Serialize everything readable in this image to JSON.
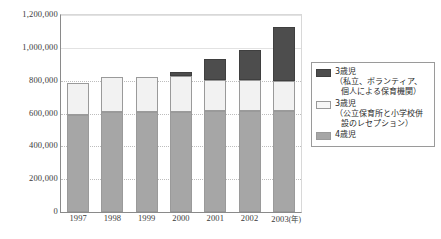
{
  "chart_data": {
    "type": "bar",
    "title": "",
    "subtitle": "",
    "xlabel": "(年)",
    "ylabel": "",
    "stacked": true,
    "grid": true,
    "legend_position": "right",
    "ylim": [
      0,
      1200000
    ],
    "ytick_step": 200000,
    "categories": [
      "1997",
      "1998",
      "1999",
      "2000",
      "2001",
      "2002",
      "2003"
    ],
    "ytick_labels": [
      "0",
      "200,000",
      "400,000",
      "600,000",
      "800,000",
      "1,000,000",
      "1,200,000"
    ],
    "ytick_values": [
      0,
      200000,
      400000,
      600000,
      800000,
      1000000,
      1200000
    ],
    "xtick_labels": [
      "1997",
      "1998",
      "1999",
      "2000",
      "2001",
      "2002",
      "2003"
    ],
    "xaxis_unit": "(年)",
    "series": [
      {
        "name": "4歳児",
        "key": "y4",
        "color": "#a6a6a6",
        "values": [
          588000,
          608000,
          610000,
          612000,
          614000,
          616000,
          618000
        ]
      },
      {
        "name": "3歳児（公立保育所と小学校併設のレセプション）",
        "key": "y3pub",
        "color": "#f2f2f2",
        "values": [
          197000,
          214000,
          211000,
          216000,
          192000,
          190000,
          182000
        ]
      },
      {
        "name": "3歳児（私立、ボランティア、個人による保育機関）",
        "key": "y3priv",
        "color": "#4d4d4d",
        "values": [
          0,
          0,
          0,
          22000,
          129000,
          179000,
          330000
        ]
      }
    ],
    "totals": [
      785000,
      822000,
      821000,
      850000,
      935000,
      985000,
      1130000
    ]
  },
  "legend": {
    "items": [
      {
        "swatch": "y3priv",
        "main": "3歳児",
        "sub": "（私立、ボランティア、",
        "sub2": "個人による保育機関）"
      },
      {
        "swatch": "y3pub",
        "main": "3歳児",
        "sub": "（公立保育所と小学校併",
        "sub2": "設のレセプション）"
      },
      {
        "swatch": "y4",
        "main": "4歳児",
        "sub": "",
        "sub2": ""
      }
    ]
  },
  "bottom_caption": ""
}
